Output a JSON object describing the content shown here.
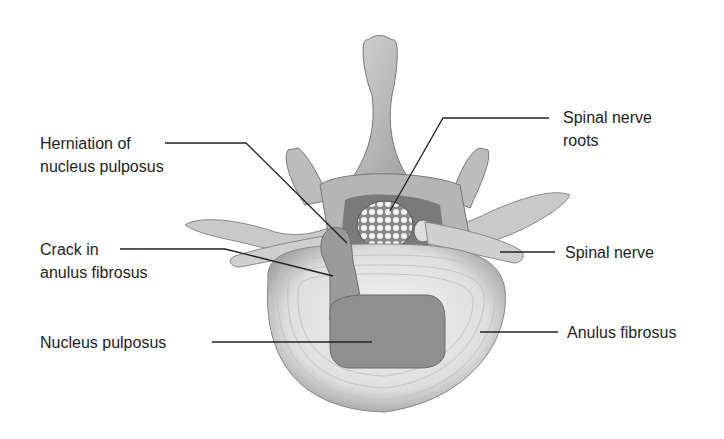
{
  "figure": {
    "labels": [
      {
        "id": "herniation",
        "lines": [
          "Herniation of",
          "nucleus pulposus"
        ]
      },
      {
        "id": "crack",
        "lines": [
          "Crack in",
          "anulus fibrosus"
        ]
      },
      {
        "id": "nucleus",
        "lines": [
          "Nucleus pulposus"
        ]
      },
      {
        "id": "roots",
        "lines": [
          "Spinal nerve",
          "roots"
        ]
      },
      {
        "id": "nerve",
        "lines": [
          "Spinal nerve"
        ]
      },
      {
        "id": "anulus",
        "lines": [
          "Anulus fibrosus"
        ]
      }
    ]
  },
  "colors": {
    "background": "#ffffff",
    "text": "#1e1e1e",
    "leader": "#222222",
    "bone": "#bdbdbd",
    "bone_dark": "#8f8f8f",
    "disc": "#e6e6e6",
    "nucleus": "#8c8c8c"
  }
}
